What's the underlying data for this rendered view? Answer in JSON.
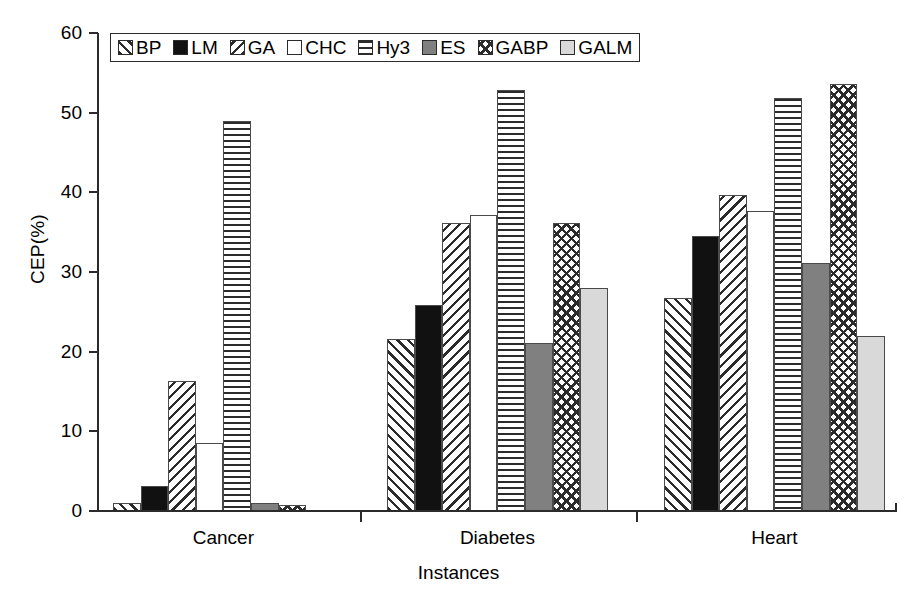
{
  "chart_data": {
    "type": "bar",
    "title": "",
    "xlabel": "Instances",
    "ylabel": "CEP(%)",
    "categories": [
      "Cancer",
      "Diabetes",
      "Heart"
    ],
    "ylim": [
      0,
      60
    ],
    "yticks": [
      0,
      10,
      20,
      30,
      40,
      50,
      60
    ],
    "ytick_labels": [
      "0",
      "10",
      "20",
      "30",
      "40",
      "50",
      "60"
    ],
    "grid": false,
    "legend_position": "top-left-inside",
    "series": [
      {
        "name": "BP",
        "pattern": "diagonal-up-hatch",
        "values": [
          1.0,
          21.6,
          26.7
        ]
      },
      {
        "name": "LM",
        "pattern": "solid-black",
        "values": [
          3.1,
          25.8,
          34.5
        ]
      },
      {
        "name": "GA",
        "pattern": "diagonal-down-hatch",
        "values": [
          16.3,
          36.2,
          39.7
        ]
      },
      {
        "name": "CHC",
        "pattern": "empty-white",
        "values": [
          8.6,
          37.2,
          37.7
        ]
      },
      {
        "name": "Hy3",
        "pattern": "horizontal-lines",
        "values": [
          49.0,
          52.8,
          51.9
        ]
      },
      {
        "name": "ES",
        "pattern": "solid-gray",
        "values": [
          1.0,
          21.1,
          31.1
        ]
      },
      {
        "name": "GABP",
        "pattern": "cross-hatch",
        "values": [
          0.8,
          36.1,
          53.6
        ]
      },
      {
        "name": "GALM",
        "pattern": "light-gray",
        "values": [
          0.0,
          28.0,
          22.0
        ]
      }
    ]
  },
  "axes": {
    "y_title": "CEP(%)",
    "x_title": "Instances",
    "y_tick_labels": [
      "60",
      "50",
      "40",
      "30",
      "20",
      "10",
      "0"
    ],
    "x_tick_labels": [
      "Cancer",
      "Diabetes",
      "Heart"
    ]
  },
  "legend": {
    "items": [
      {
        "label": "BP"
      },
      {
        "label": "LM"
      },
      {
        "label": "GA"
      },
      {
        "label": "CHC"
      },
      {
        "label": "Hy3"
      },
      {
        "label": "ES"
      },
      {
        "label": "GABP"
      },
      {
        "label": "GALM"
      }
    ]
  },
  "colors": {
    "axis": "#2b2b2b",
    "bar_outline": "#4a4a4a",
    "solid_black": "#111111",
    "solid_gray": "#808080",
    "light_gray": "#d9d9d9",
    "background": "#ffffff"
  }
}
